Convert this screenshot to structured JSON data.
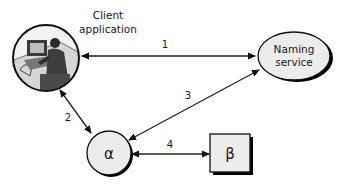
{
  "diagram": {
    "client": {
      "label_line1": "Client",
      "label_line2": "application",
      "icon": "person-at-computer-icon"
    },
    "naming_service": {
      "label_line1": "Naming",
      "label_line2": "service"
    },
    "alpha": {
      "label": "α"
    },
    "beta": {
      "label": "β"
    },
    "edges": [
      {
        "id": "1",
        "label": "1",
        "from": "Client application",
        "to": "Naming service",
        "direction": "bidirectional"
      },
      {
        "id": "2",
        "label": "2",
        "from": "Client application",
        "to": "α",
        "direction": "bidirectional"
      },
      {
        "id": "3",
        "label": "3",
        "from": "α",
        "to": "Naming service",
        "direction": "bidirectional"
      },
      {
        "id": "4",
        "label": "4",
        "from": "α",
        "to": "β",
        "direction": "bidirectional"
      }
    ],
    "colors": {
      "node_fill": "#ececec",
      "stroke": "#111111",
      "shadow": "#000000"
    }
  }
}
